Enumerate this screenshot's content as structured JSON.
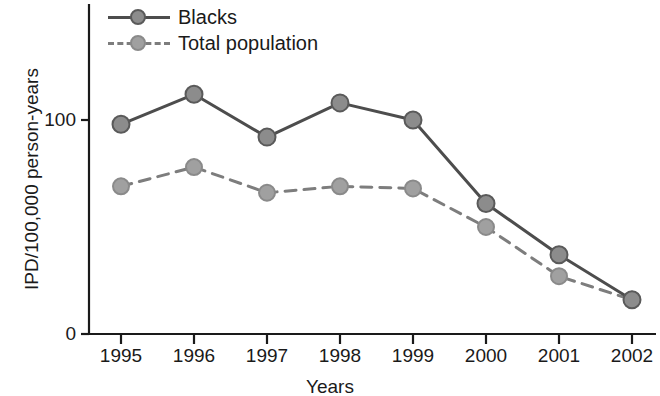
{
  "chart_data": {
    "type": "line",
    "title": "",
    "xlabel": "Years",
    "ylabel": "IPD/100,000 person-years",
    "categories": [
      "1995",
      "1996",
      "1997",
      "1998",
      "1999",
      "2000",
      "2001",
      "2002"
    ],
    "x": [
      1995,
      1996,
      1997,
      1998,
      1999,
      2000,
      2001,
      2002
    ],
    "series": [
      {
        "name": "Blacks",
        "values": [
          98,
          112,
          92,
          108,
          100,
          61,
          37,
          16
        ],
        "line_style": "solid",
        "color": "#4d4d4d",
        "marker": "circle",
        "marker_color": "#8c8c8c"
      },
      {
        "name": "Total population",
        "values": [
          69,
          78,
          66,
          69,
          68,
          50,
          27,
          16
        ],
        "line_style": "dashed",
        "color": "#7d7d7d",
        "marker": "circle",
        "marker_color": "#a0a0a0"
      }
    ],
    "ylim": [
      0,
      145
    ],
    "yticks": [
      0,
      100
    ],
    "ytick_labels": [
      "0",
      "100"
    ],
    "grid": false,
    "legend_position": "top-left"
  },
  "axes": {
    "ylabel": "IPD/100,000 person-years",
    "xlabel": "Years",
    "ytick_labels": [
      "100",
      "0"
    ],
    "xtick_labels": [
      "1995",
      "1996",
      "1997",
      "1998",
      "1999",
      "2000",
      "2001",
      "2002"
    ]
  },
  "legend": {
    "entries": [
      {
        "label": "Blacks"
      },
      {
        "label": "Total population"
      }
    ]
  },
  "colors": {
    "axis": "#1a1a1a",
    "series_blacks": "#4d4d4d",
    "series_total": "#7d7d7d",
    "marker_blacks": "#8c8c8c",
    "marker_total": "#a0a0a0",
    "background": "#ffffff"
  }
}
